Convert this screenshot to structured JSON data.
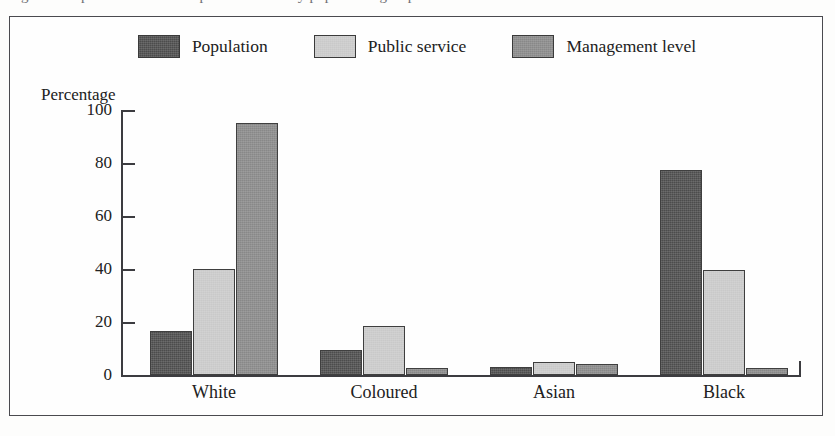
{
  "caption": {
    "text": "Figure 3   Representation in the public service by population group"
  },
  "chart_data": {
    "type": "bar",
    "title": "",
    "xlabel": "",
    "ylabel": "Percentage",
    "ylim": [
      0,
      100
    ],
    "yticks": [
      0,
      20,
      40,
      60,
      80,
      100
    ],
    "ytick_labels": [
      "0",
      "20",
      "40",
      "60",
      "80",
      "100"
    ],
    "grid": false,
    "legend_position": "top-center",
    "categories": [
      "White",
      "Coloured",
      "Asian",
      "Black"
    ],
    "series": [
      {
        "name": "Population",
        "color": "#4c4c4c",
        "values": [
          16.5,
          9.5,
          3.0,
          77.5
        ]
      },
      {
        "name": "Public service",
        "color": "#c9c9c9",
        "values": [
          40.0,
          18.5,
          5.0,
          39.5
        ]
      },
      {
        "name": "Management level",
        "color": "#888888",
        "values": [
          95.0,
          2.5,
          4.0,
          2.5
        ]
      }
    ]
  },
  "colors": {
    "frame": "#4a4a4f",
    "axis": "#3c3c40",
    "text": "#212121",
    "paper": "#fdfdfc"
  }
}
